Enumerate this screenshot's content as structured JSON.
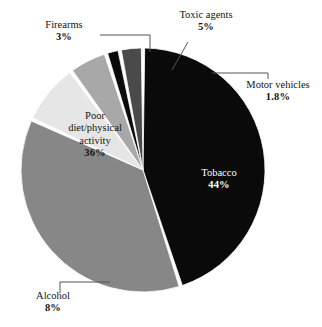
{
  "chart_data": {
    "type": "pie",
    "title": "",
    "subtitle": "",
    "xlabel": "",
    "ylabel": "",
    "legend_position": "none",
    "grid": false,
    "labels_show_percent": true,
    "start_angle_deg": -90,
    "direction": "clockwise",
    "categories": [
      "Tobacco",
      "Poor diet/physical activity",
      "Alcohol",
      "Toxic agents",
      "Motor vehicles",
      "Firearms"
    ],
    "values": [
      44,
      36,
      8,
      5,
      1.8,
      3
    ],
    "value_labels": [
      "44%",
      "36%",
      "8%",
      "5%",
      "1.8%",
      "3%"
    ],
    "slices": [
      {
        "id": "tobacco",
        "name": "Tobacco",
        "value": 44,
        "value_label": "44%",
        "color": "#0a0a0a",
        "label_placement": "inside",
        "label_color": "#ffffff",
        "leader_line": false
      },
      {
        "id": "poor-diet",
        "name": "Poor\ndiet/physical\nactivity",
        "name_flat": "Poor diet/physical activity",
        "value": 36,
        "value_label": "36%",
        "color": "#878787",
        "label_placement": "inside",
        "label_color": "#141414",
        "leader_line": false
      },
      {
        "id": "alcohol",
        "name": "Alcohol",
        "value": 8,
        "value_label": "8%",
        "color": "#e6e6e6",
        "label_placement": "outside",
        "label_color": "#141414",
        "leader_line": true
      },
      {
        "id": "toxic-agents",
        "name": "Toxic agents",
        "value": 5,
        "value_label": "5%",
        "color": "#a8a8a8",
        "label_placement": "outside",
        "label_color": "#141414",
        "leader_line": true
      },
      {
        "id": "motor-vehicles",
        "name": "Motor vehicles",
        "value": 1.8,
        "value_label": "1.8%",
        "color": "#0a0a0a",
        "label_placement": "outside",
        "label_color": "#141414",
        "leader_line": true
      },
      {
        "id": "firearms",
        "name": "Firearms",
        "value": 3,
        "value_label": "3%",
        "color": "#4a4a4a",
        "label_placement": "outside",
        "label_color": "#141414",
        "leader_line": true
      }
    ],
    "colors": {
      "tobacco": "#0a0a0a",
      "poor_diet": "#878787",
      "alcohol": "#e6e6e6",
      "toxic_agents": "#a8a8a8",
      "motor_vehicles": "#0a0a0a",
      "firearms": "#4a4a4a",
      "background": "#ffffff",
      "separator": "#ffffff",
      "leader_line": "#55555 5"
    },
    "geometry": {
      "center_x": 143,
      "center_y": 170,
      "radius": 122
    }
  },
  "labels": {
    "firearms": {
      "name": "Firearms",
      "pct": "3%"
    },
    "toxic_agents": {
      "name": "Toxic agents",
      "pct": "5%"
    },
    "motor_vehicles": {
      "name": "Motor vehicles",
      "pct": "1.8%"
    },
    "tobacco": {
      "name": "Tobacco",
      "pct": "44%"
    },
    "poor_diet": {
      "name": "Poor\ndiet/physical\nactivity",
      "pct": "36%"
    },
    "alcohol": {
      "name": "Alcohol",
      "pct": "8%"
    }
  }
}
